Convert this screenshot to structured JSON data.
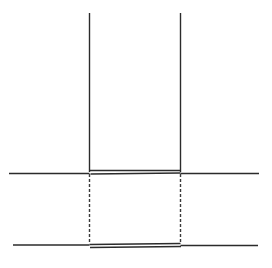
{
  "figure": {
    "title": "Technical line drawing — vertical member section",
    "type": "line-drawing",
    "width": 272,
    "height": 268,
    "background_color": "#ffffff",
    "stroke_color": "#3a3a3a",
    "stroke_color_dark": "#2b2b2b",
    "stroke_width": 1.4,
    "dash_pattern": "3 2"
  },
  "chart_data": {
    "type": "line",
    "title": "",
    "xlabel": "",
    "ylabel": "",
    "grid": false,
    "legend": "none",
    "xlim": [
      0,
      272
    ],
    "ylim": [
      0,
      268
    ],
    "series": [
      {
        "name": "upper-member-left-edge",
        "style": "solid",
        "points": [
          [
            89.5,
            13.0
          ],
          [
            89.5,
            172.0
          ]
        ]
      },
      {
        "name": "upper-member-right-edge",
        "style": "solid",
        "points": [
          [
            180.5,
            13.0
          ],
          [
            180.5,
            172.0
          ]
        ]
      },
      {
        "name": "upper-member-base-outer",
        "style": "solid",
        "points": [
          [
            89.5,
            170.5
          ],
          [
            180.5,
            170.5
          ]
        ]
      },
      {
        "name": "upper-member-base-inner",
        "style": "solid",
        "points": [
          [
            90.5,
            174.0
          ],
          [
            180.5,
            173.0
          ]
        ]
      },
      {
        "name": "upper-datum-line-left",
        "style": "solid",
        "points": [
          [
            9.0,
            173.5
          ],
          [
            89.5,
            173.5
          ]
        ]
      },
      {
        "name": "upper-datum-line-right",
        "style": "solid",
        "points": [
          [
            180.5,
            173.5
          ],
          [
            259.0,
            173.5
          ]
        ]
      },
      {
        "name": "hidden-edge-left",
        "style": "dashed",
        "points": [
          [
            89.5,
            174.0
          ],
          [
            89.5,
            244.0
          ]
        ]
      },
      {
        "name": "hidden-edge-right",
        "style": "dashed",
        "points": [
          [
            180.5,
            174.0
          ],
          [
            180.5,
            244.0
          ]
        ]
      },
      {
        "name": "lower-member-base-outer",
        "style": "solid",
        "points": [
          [
            89.5,
            244.5
          ],
          [
            180.5,
            243.5
          ]
        ]
      },
      {
        "name": "lower-member-base-inner",
        "style": "solid",
        "points": [
          [
            90.0,
            247.5
          ],
          [
            181.0,
            246.5
          ]
        ]
      },
      {
        "name": "lower-datum-line-left",
        "style": "solid",
        "points": [
          [
            13.0,
            245.0
          ],
          [
            89.5,
            245.0
          ]
        ]
      },
      {
        "name": "lower-datum-line-right",
        "style": "solid",
        "points": [
          [
            180.5,
            245.5
          ],
          [
            258.0,
            245.5
          ]
        ]
      }
    ],
    "annotations": []
  }
}
